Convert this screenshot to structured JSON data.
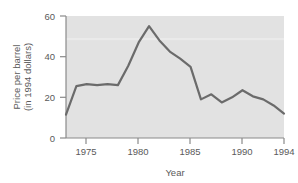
{
  "chart_data": {
    "type": "line",
    "title": "",
    "subtitle": "",
    "xlabel": "Year",
    "ylabel_line1": "Price per barrel",
    "ylabel_line2": "(in 1994 dollars)",
    "ylabel": "Price per barrel (in 1994 dollars)",
    "xlim": [
      1973,
      1994
    ],
    "ylim": [
      0,
      60
    ],
    "xticks": [
      1975,
      1980,
      1985,
      1990,
      1994
    ],
    "xtick_labels": [
      "1975",
      "1980",
      "1985",
      "1990",
      "1994"
    ],
    "yticks": [
      0,
      20,
      40,
      60
    ],
    "ytick_labels": [
      "0",
      "20",
      "40",
      "60"
    ],
    "grid": false,
    "legend": "none",
    "plot_background": "#e2e2e2",
    "line_color": "#6b6b6b",
    "axis_color": "#8a8a8a",
    "line_width": 2.2,
    "x": [
      1973,
      1974,
      1975,
      1976,
      1977,
      1978,
      1979,
      1980,
      1981,
      1982,
      1983,
      1984,
      1985,
      1986,
      1987,
      1988,
      1989,
      1990,
      1991,
      1992,
      1993,
      1994
    ],
    "values": [
      11.5,
      25.5,
      26.5,
      26.0,
      26.5,
      26.0,
      35.5,
      47.0,
      55.0,
      48.0,
      42.5,
      39.0,
      35.0,
      19.0,
      21.5,
      17.5,
      20.0,
      23.5,
      20.5,
      19.0,
      16.0,
      12.0
    ],
    "series": [
      {
        "name": "Price per barrel (in 1994 dollars)",
        "values": [
          11.5,
          25.5,
          26.5,
          26.0,
          26.5,
          26.0,
          35.5,
          47.0,
          55.0,
          48.0,
          42.5,
          39.0,
          35.0,
          19.0,
          21.5,
          17.5,
          20.0,
          23.5,
          20.5,
          19.0,
          16.0,
          12.0
        ]
      }
    ]
  },
  "figure": {
    "y_axis_label_line1": "Price per barrel",
    "y_axis_label_line2": "(in 1994 dollars)",
    "x_axis_label": "Year",
    "ytick_0": "0",
    "ytick_1": "20",
    "ytick_2": "40",
    "ytick_3": "60",
    "xtick_0": "1975",
    "xtick_1": "1980",
    "xtick_2": "1985",
    "xtick_3": "1990",
    "xtick_4": "1994"
  }
}
